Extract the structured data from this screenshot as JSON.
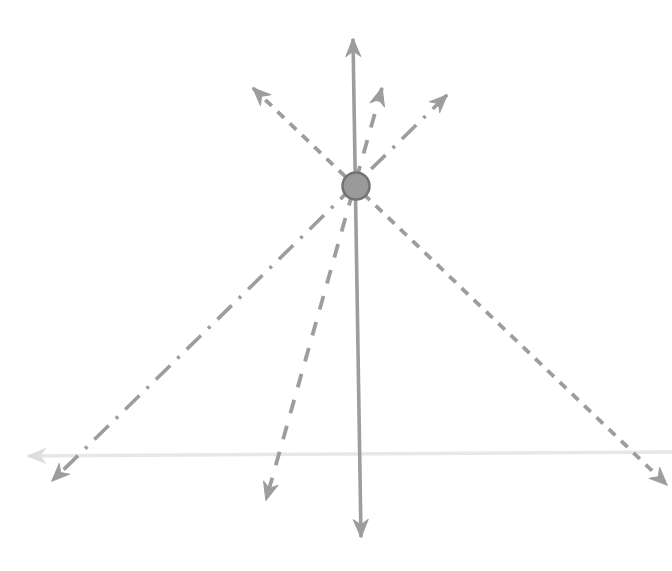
{
  "diagram": {
    "canvas": {
      "width": 672,
      "height": 571,
      "background": "#ffffff"
    },
    "colors": {
      "vector_gray": "#9d9d9d",
      "ground_gray": "#e7e7e7",
      "ground_arrow_gray": "#dedede",
      "ball_fill": "#9a9a9a",
      "ball_stroke": "#737373"
    },
    "ball": {
      "name": "ball",
      "cx": 356,
      "cy": 186,
      "r": 13.5,
      "stroke_width": 2.5
    },
    "ground_line": {
      "name": "ground-line",
      "x1": 672,
      "y1": 452,
      "x2": 28,
      "y2": 456,
      "stroke_width": 3.5,
      "dash": "",
      "color_key": "ground_gray",
      "arrow_color_key": "ground_arrow_gray",
      "arrow_start": false,
      "arrow_end": true
    },
    "vectors": [
      {
        "name": "vector-dash-dot-diagonal",
        "style": "dash-dot",
        "x1": 447,
        "y1": 95,
        "x2": 52,
        "y2": 481,
        "dash": "20 10 3 10",
        "stroke_width": 3.6,
        "color_key": "vector_gray",
        "arrow_color_key": "vector_gray",
        "arrow_start": true,
        "arrow_end": true
      },
      {
        "name": "vector-long-dash-steep",
        "style": "long-dash",
        "x1": 382,
        "y1": 88,
        "x2": 266,
        "y2": 500,
        "dash": "14 13",
        "stroke_width": 3.8,
        "color_key": "vector_gray",
        "arrow_color_key": "vector_gray",
        "arrow_start": true,
        "arrow_end": true
      },
      {
        "name": "vector-dashed-diagonal",
        "style": "dashed",
        "x1": 253,
        "y1": 88,
        "x2": 667,
        "y2": 485,
        "dash": "9 8",
        "stroke_width": 3.8,
        "color_key": "vector_gray",
        "arrow_color_key": "vector_gray",
        "arrow_start": true,
        "arrow_end": true
      },
      {
        "name": "vector-solid-vertical",
        "style": "solid",
        "x1": 353,
        "y1": 39,
        "x2": 361,
        "y2": 537,
        "dash": "",
        "stroke_width": 3.6,
        "color_key": "vector_gray",
        "arrow_color_key": "vector_gray",
        "arrow_start": true,
        "arrow_end": true
      }
    ]
  }
}
